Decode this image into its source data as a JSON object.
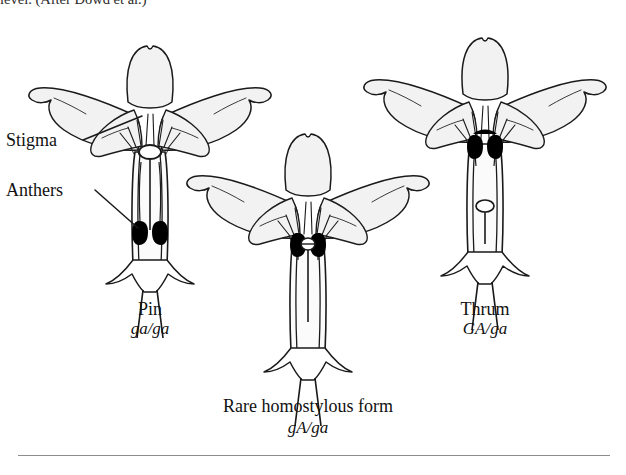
{
  "figure": {
    "caption_top": "level. (After Dowd et al.)",
    "background_color": "#ffffff",
    "petal_fill": "#f2f2f2",
    "outline_color": "#1a1a1a",
    "anther_color": "#000000",
    "stigma_color": "#ffffff"
  },
  "callouts": [
    {
      "label": "Stigma",
      "target": "pin-stigma"
    },
    {
      "label": "Anthers",
      "target": "pin-anthers"
    }
  ],
  "flowers": [
    {
      "id": "pin",
      "name": "Pin",
      "genotype": "ga/ga",
      "stigma_position": "high",
      "anther_position": "low"
    },
    {
      "id": "homostylous",
      "name": "Rare homostylous form",
      "genotype": "gA/ga",
      "stigma_position": "same-level",
      "anther_position": "same-level"
    },
    {
      "id": "thrum",
      "name": "Thrum",
      "genotype": "GA/ga",
      "stigma_position": "low",
      "anther_position": "high"
    }
  ]
}
